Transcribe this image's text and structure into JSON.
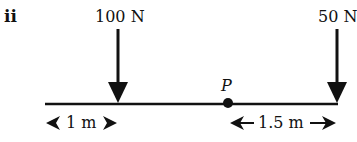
{
  "diagram": {
    "part_label": "ii",
    "beam": {
      "color": "#111111"
    },
    "forces": [
      {
        "label": "100 N",
        "direction": "down",
        "position": "1 m from left end"
      },
      {
        "label": "50 N",
        "direction": "down",
        "position": "right end"
      }
    ],
    "point": {
      "label": "P"
    },
    "dimensions": [
      {
        "label": "1 m",
        "from": "left end",
        "to": "100 N force"
      },
      {
        "label": "1.5 m",
        "from": "P",
        "to": "50 N force"
      }
    ]
  }
}
